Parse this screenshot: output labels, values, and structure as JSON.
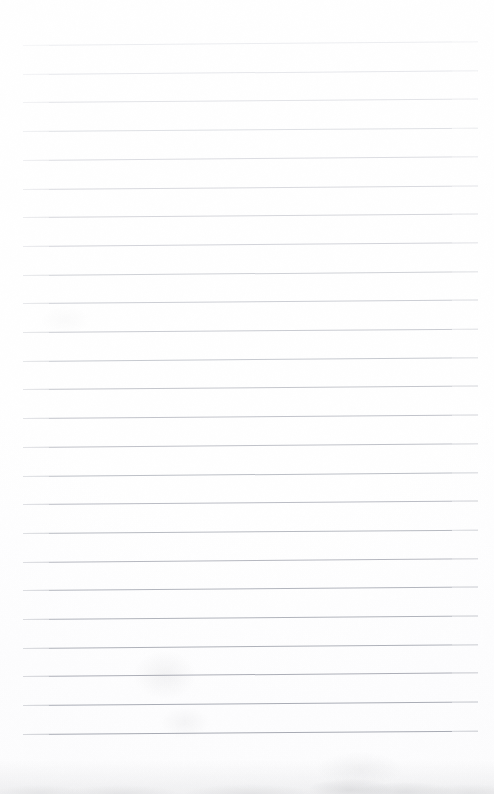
{
  "document": {
    "kind": "scanned-lined-paper",
    "title": "Blank ruled notebook page (scan)",
    "page_width": 494,
    "page_height": 794,
    "background_color": "#fefeff",
    "content_text": "",
    "has_handwriting": false,
    "has_printed_text": false
  },
  "ruling": {
    "line_count": 25,
    "first_line_y": 45,
    "line_spacing": 28.7,
    "line_left_x": 23,
    "line_right_x": 478,
    "line_thickness": 1,
    "tilt_degrees": -0.45,
    "base_color": "#c9cbd2",
    "top_color": "#edeef1",
    "bottom_color": "#a8abb4",
    "note": "lines fade toward the top of the page and darken toward the bottom"
  },
  "artifacts": {
    "bottom_smudge_label": "bottom edge grime band",
    "bottom_smudge_color": "#7d7f84",
    "stain_label": "faint gray stain",
    "stain_color": "#82828a",
    "top_margin_height": 45,
    "bottom_margin_height": 61
  }
}
